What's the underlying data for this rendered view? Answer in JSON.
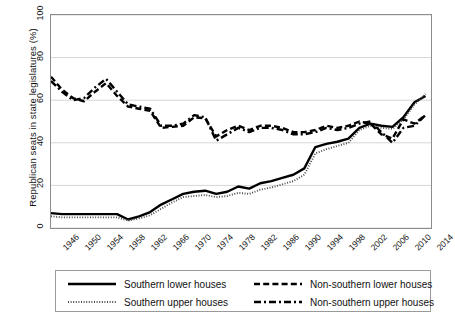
{
  "chart_data": {
    "type": "line",
    "title": "",
    "xlabel": "",
    "ylabel": "Republican seats in state legislatures (%)",
    "xlim": [
      1946,
      2015
    ],
    "ylim": [
      0,
      100
    ],
    "yticks": [
      0,
      20,
      40,
      60,
      80,
      100
    ],
    "ytick_labels": [
      "0",
      "20",
      "40",
      "60",
      "80",
      "100"
    ],
    "xticks": [
      1946,
      1950,
      1954,
      1958,
      1962,
      1966,
      1970,
      1974,
      1978,
      1982,
      1986,
      1990,
      1994,
      1998,
      2002,
      2006,
      2010,
      2014
    ],
    "xtick_labels": [
      "1946",
      "1950",
      "1954",
      "1958",
      "1962",
      "1966",
      "1970",
      "1974",
      "1978",
      "1982",
      "1986",
      "1990",
      "1994",
      "1998",
      "2002",
      "2006",
      "2010",
      "2014"
    ],
    "grid": "horizontal",
    "legend_position": "below-axes",
    "x": [
      1946,
      1948,
      1950,
      1952,
      1954,
      1956,
      1958,
      1960,
      1962,
      1964,
      1966,
      1968,
      1970,
      1972,
      1974,
      1976,
      1978,
      1980,
      1982,
      1984,
      1986,
      1988,
      1990,
      1992,
      1994,
      1996,
      1998,
      2000,
      2002,
      2004,
      2006,
      2008,
      2010,
      2012,
      2014
    ],
    "series": [
      {
        "name": "Southern lower houses",
        "style": "solid",
        "color": "#000000",
        "values": [
          7,
          6.5,
          6.5,
          6.5,
          6.5,
          6.5,
          6.5,
          4,
          5.5,
          7.5,
          11,
          13.5,
          16,
          17,
          17.5,
          16,
          17,
          19.5,
          18.5,
          21,
          22,
          23.5,
          25,
          28,
          38,
          39.5,
          40.5,
          42,
          47,
          49,
          48,
          47.5,
          52,
          59,
          62
        ]
      },
      {
        "name": "Southern upper houses",
        "style": "dotted",
        "color": "#4d4d4d",
        "values": [
          5.5,
          5,
          5,
          5,
          5,
          5,
          5,
          3.5,
          4.5,
          6,
          9,
          12,
          14.5,
          15,
          15.5,
          14.5,
          15,
          16.5,
          16,
          18,
          19,
          20.5,
          22,
          25,
          35,
          37,
          38.5,
          40,
          46,
          48,
          47,
          46.5,
          51,
          58,
          63
        ]
      },
      {
        "name": "Non-southern lower houses",
        "style": "dashed",
        "color": "#000000",
        "values": [
          71,
          65,
          61,
          59.5,
          64,
          68,
          62,
          57,
          56,
          55,
          47,
          47.5,
          48,
          52,
          51.5,
          43,
          46,
          48,
          46,
          48,
          48,
          47,
          45,
          45,
          46,
          48,
          47,
          48,
          50,
          49,
          44,
          42,
          51,
          49,
          53
        ]
      },
      {
        "name": "Non-southern upper houses",
        "style": "dash-dot",
        "color": "#000000",
        "values": [
          69,
          64,
          60,
          61,
          66,
          70,
          64,
          58,
          57,
          56,
          48,
          48,
          49,
          53,
          52,
          41,
          44,
          47,
          45,
          47,
          47,
          46,
          44,
          44,
          45,
          47,
          46,
          47,
          49,
          50,
          45,
          40,
          47,
          48,
          53
        ]
      }
    ]
  },
  "legend": {
    "entries": [
      {
        "label": "Southern lower houses",
        "style": "solid"
      },
      {
        "label": "Southern upper houses",
        "style": "dotted"
      },
      {
        "label": "Non-southern lower houses",
        "style": "dashed"
      },
      {
        "label": "Non-southern upper houses",
        "style": "dash-dot"
      }
    ]
  }
}
